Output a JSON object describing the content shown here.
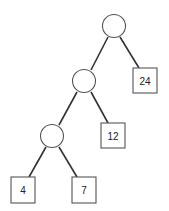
{
  "diagram": {
    "type": "binary-tree",
    "internal_nodes": [
      {
        "id": "root",
        "cx": 114,
        "cy": 26
      },
      {
        "id": "n1",
        "cx": 84,
        "cy": 81
      },
      {
        "id": "n2",
        "cx": 52,
        "cy": 136
      }
    ],
    "leaves": [
      {
        "id": "leaf-24",
        "label": "24",
        "x": 133,
        "y": 68
      },
      {
        "id": "leaf-12",
        "label": "12",
        "x": 101,
        "y": 123
      },
      {
        "id": "leaf-4",
        "label": "4",
        "x": 11,
        "y": 177
      },
      {
        "id": "leaf-7",
        "label": "7",
        "x": 72,
        "y": 177
      }
    ],
    "edges": [
      [
        "root",
        "n1"
      ],
      [
        "root",
        "leaf-24"
      ],
      [
        "n1",
        "n2"
      ],
      [
        "n1",
        "leaf-12"
      ],
      [
        "n2",
        "leaf-4"
      ],
      [
        "n2",
        "leaf-7"
      ]
    ]
  }
}
